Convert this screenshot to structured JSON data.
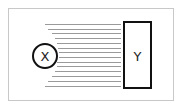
{
  "diagram": {
    "type": "field-lines",
    "source": {
      "label": "X",
      "shape": "circle",
      "cx": 45,
      "cy": 56,
      "r": 12
    },
    "target": {
      "label": "Y",
      "shape": "rectangle",
      "x": 124,
      "y": 22,
      "width": 27,
      "height": 66
    },
    "frame": {
      "x": 8.5,
      "y": 8.5,
      "width": 165,
      "height": 92
    },
    "lines": {
      "count": 14,
      "end_x": 121,
      "items": [
        {
          "y": 24,
          "start_x": 45
        },
        {
          "y": 29,
          "start_x": 48
        },
        {
          "y": 33,
          "start_x": 52
        },
        {
          "y": 38,
          "start_x": 55
        },
        {
          "y": 43,
          "start_x": 57
        },
        {
          "y": 48,
          "start_x": 58
        },
        {
          "y": 52,
          "start_x": 59
        },
        {
          "y": 57,
          "start_x": 59
        },
        {
          "y": 62,
          "start_x": 57
        },
        {
          "y": 66,
          "start_x": 57
        },
        {
          "y": 71,
          "start_x": 55
        },
        {
          "y": 76,
          "start_x": 52
        },
        {
          "y": 81,
          "start_x": 48
        },
        {
          "y": 86,
          "start_x": 45
        }
      ]
    },
    "colors": {
      "stroke": "#111111",
      "lines": "#9a9a9a",
      "frame": "#c8c8c8"
    }
  }
}
